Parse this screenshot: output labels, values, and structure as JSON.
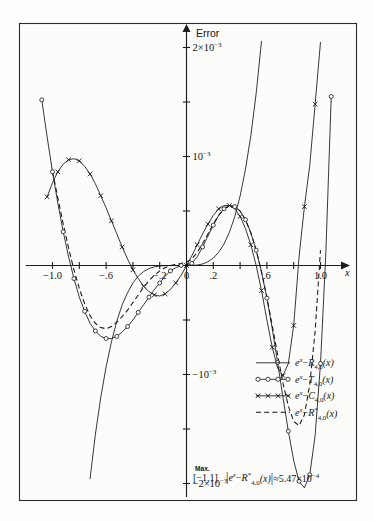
{
  "chart_data": {
    "type": "line",
    "title": "",
    "xlabel": "x",
    "ylabel": "Error",
    "xlim": [
      -1.12,
      1.12
    ],
    "ylim": [
      -0.00235,
      0.00235
    ],
    "grid": false,
    "legend_position": "bottom-right",
    "x_ticks": [
      {
        "value": -1.0,
        "label": "−1.0"
      },
      {
        "value": -0.8,
        "label": ""
      },
      {
        "value": -0.6,
        "label": "−.6"
      },
      {
        "value": -0.4,
        "label": ""
      },
      {
        "value": -0.2,
        "label": "−.2"
      },
      {
        "value": 0.0,
        "label": "0"
      },
      {
        "value": 0.2,
        "label": ".2"
      },
      {
        "value": 0.4,
        "label": ""
      },
      {
        "value": 0.6,
        "label": ".6"
      },
      {
        "value": 0.8,
        "label": ""
      },
      {
        "value": 1.0,
        "label": "1.0"
      }
    ],
    "y_ticks": [
      {
        "value": 0.002,
        "label": "2×10⁻³"
      },
      {
        "value": 0.0015,
        "label": ""
      },
      {
        "value": 0.001,
        "label": "10⁻³"
      },
      {
        "value": 0.0005,
        "label": ""
      },
      {
        "value": -0.0005,
        "label": ""
      },
      {
        "value": -0.001,
        "label": "−10⁻³"
      },
      {
        "value": -0.0015,
        "label": ""
      },
      {
        "value": -0.002,
        "label": "−2×10⁻³"
      }
    ],
    "series": [
      {
        "name": "e^x-R_{4,0}(x)",
        "style": "solid",
        "marker": "none",
        "x": [
          -0.76,
          -0.72,
          -0.68,
          -0.64,
          -0.6,
          -0.56,
          -0.52,
          -0.48,
          -0.44,
          -0.4,
          -0.36,
          -0.32,
          -0.28,
          -0.24,
          -0.2,
          -0.16,
          -0.12,
          -0.08,
          -0.04,
          0.0,
          0.04,
          0.08,
          0.12,
          0.16,
          0.2,
          0.24,
          0.28,
          0.32,
          0.36,
          0.4,
          0.44,
          0.48,
          0.52,
          0.56,
          0.6,
          0.64,
          0.68,
          0.72,
          0.76,
          0.8
        ],
        "y": [
          -0.00245,
          -0.00196,
          -0.00155,
          -0.00121,
          -0.00093,
          -0.0007,
          -0.00051,
          -0.00036,
          -0.00025,
          -0.00016,
          -9.8e-05,
          -5.5e-05,
          -2.8e-05,
          -1.25e-05,
          -4.5e-06,
          -1.2e-06,
          -2e-07,
          0.0,
          2e-07,
          0.0,
          5e-07,
          4e-06,
          1.4e-05,
          3.4e-05,
          6.8e-05,
          0.000121,
          0.000197,
          0.000304,
          0.000448,
          0.000637,
          0.000882,
          0.00119,
          0.00158,
          0.00206,
          0.00265,
          0.00336,
          0.00421,
          0.00521,
          0.00639,
          0.00776
        ]
      },
      {
        "name": "e^x-T_{4,0}(x)",
        "style": "solid",
        "marker": "circle",
        "x": [
          -1.08,
          -1.04,
          -1.0,
          -0.96,
          -0.92,
          -0.88,
          -0.84,
          -0.8,
          -0.76,
          -0.72,
          -0.68,
          -0.64,
          -0.6,
          -0.56,
          -0.52,
          -0.48,
          -0.44,
          -0.4,
          -0.36,
          -0.32,
          -0.28,
          -0.24,
          -0.2,
          -0.16,
          -0.12,
          -0.08,
          -0.04,
          0.0,
          0.04,
          0.08,
          0.12,
          0.16,
          0.2,
          0.24,
          0.28,
          0.32,
          0.36,
          0.4,
          0.44,
          0.48,
          0.52,
          0.56,
          0.6,
          0.64,
          0.68,
          0.72,
          0.76,
          0.8,
          0.84,
          0.88,
          0.92,
          0.96,
          1.0,
          1.04,
          1.08
        ],
        "y": [
          0.00152,
          0.00118,
          0.00086,
          0.00057,
          0.00031,
          8e-05,
          -0.00012,
          -0.00029,
          -0.00042,
          -0.00053,
          -0.0006,
          -0.00065,
          -0.00067,
          -0.00067,
          -0.00065,
          -0.00061,
          -0.00056,
          -0.0005,
          -0.00043,
          -0.00036,
          -0.00029,
          -0.00022,
          -0.00016,
          -0.0001,
          -5e-05,
          -2e-05,
          0.0,
          0.0,
          2e-05,
          8e-05,
          0.00017,
          0.00027,
          0.00037,
          0.00046,
          0.00052,
          0.00055,
          0.00054,
          0.0005,
          0.00042,
          0.0003,
          0.00014,
          -6e-05,
          -0.0003,
          -0.00058,
          -0.00089,
          -0.00121,
          -0.00152,
          -0.00179,
          -0.00198,
          -0.00204,
          -0.00192,
          -0.00156,
          -0.0009,
          0.00012,
          0.00155
        ]
      },
      {
        "name": "e^x-C_{4,0}(x)",
        "style": "solid",
        "marker": "cross",
        "x": [
          -1.04,
          -1.0,
          -0.96,
          -0.92,
          -0.88,
          -0.84,
          -0.8,
          -0.76,
          -0.72,
          -0.68,
          -0.64,
          -0.6,
          -0.56,
          -0.52,
          -0.48,
          -0.44,
          -0.4,
          -0.36,
          -0.32,
          -0.28,
          -0.24,
          -0.2,
          -0.16,
          -0.12,
          -0.08,
          -0.04,
          0.0,
          0.04,
          0.08,
          0.12,
          0.16,
          0.2,
          0.24,
          0.28,
          0.32,
          0.36,
          0.4,
          0.44,
          0.48,
          0.52,
          0.56,
          0.6,
          0.64,
          0.68,
          0.72,
          0.76,
          0.8,
          0.84,
          0.88,
          0.92,
          0.96,
          1.0
        ],
        "y": [
          0.00063,
          0.00076,
          0.00086,
          0.00093,
          0.00097,
          0.00098,
          0.00096,
          0.00091,
          0.00084,
          0.00075,
          0.00064,
          0.00053,
          0.00041,
          0.00029,
          0.00017,
          6e-05,
          -4e-05,
          -0.00012,
          -0.00019,
          -0.00024,
          -0.00027,
          -0.00028,
          -0.00026,
          -0.00022,
          -0.00016,
          -9e-05,
          0.0,
          9e-05,
          0.00019,
          0.00029,
          0.00038,
          0.00046,
          0.00052,
          0.00055,
          0.00055,
          0.00052,
          0.00045,
          0.00034,
          0.00019,
          0.0,
          -0.00023,
          -0.0005,
          -0.00075,
          -0.00094,
          -0.00101,
          -0.0009,
          -0.00055,
          8e-05,
          0.00054,
          0.00092,
          0.00148,
          0.00205
        ]
      },
      {
        "name": "e^x-R*_{4,0}(x)",
        "style": "dashed",
        "marker": "none",
        "x": [
          -1.0,
          -0.96,
          -0.92,
          -0.88,
          -0.84,
          -0.8,
          -0.76,
          -0.72,
          -0.68,
          -0.64,
          -0.6,
          -0.56,
          -0.52,
          -0.48,
          -0.44,
          -0.4,
          -0.36,
          -0.32,
          -0.28,
          -0.24,
          -0.2,
          -0.16,
          -0.12,
          -0.08,
          -0.04,
          0.0,
          0.04,
          0.08,
          0.12,
          0.16,
          0.2,
          0.24,
          0.28,
          0.32,
          0.36,
          0.4,
          0.44,
          0.48,
          0.52,
          0.56,
          0.6,
          0.64,
          0.68,
          0.72,
          0.76,
          0.8,
          0.84,
          0.88,
          0.92,
          0.96,
          1.0
        ],
        "y": [
          0.00086,
          0.00062,
          0.00038,
          0.00016,
          -4e-05,
          -0.00021,
          -0.00035,
          -0.00046,
          -0.00053,
          -0.00057,
          -0.00058,
          -0.00056,
          -0.00052,
          -0.00047,
          -0.00041,
          -0.00034,
          -0.00027,
          -0.0002,
          -0.00014,
          -9e-05,
          -5e-05,
          -2e-05,
          0.0,
          1e-05,
          2e-05,
          3e-05,
          6e-05,
          0.00012,
          0.0002,
          0.00029,
          0.00038,
          0.00046,
          0.00052,
          0.00055,
          0.00054,
          0.0005,
          0.00042,
          0.0003,
          0.00014,
          -6e-05,
          -0.00029,
          -0.00055,
          -0.00082,
          -0.00108,
          -0.00129,
          -0.00143,
          -0.00147,
          -0.00137,
          -0.00109,
          -0.0006,
          0.00014
        ]
      }
    ]
  },
  "axes": {
    "y_axis_title": "Error",
    "x_axis_title": "x"
  },
  "legend": {
    "entries": [
      {
        "style": "solid",
        "marker": "none",
        "base": "e",
        "base_sup": "x",
        "minus": "−",
        "fn": "R",
        "sub": "4,0",
        "star": "",
        "arg": "(x)"
      },
      {
        "style": "solid",
        "marker": "circle",
        "base": "e",
        "base_sup": "x",
        "minus": "−",
        "fn": "T",
        "sub": "4,0",
        "star": "",
        "arg": "(x)"
      },
      {
        "style": "solid",
        "marker": "cross",
        "base": "e",
        "base_sup": "x",
        "minus": "−",
        "fn": "C",
        "sub": "4,0",
        "star": "",
        "arg": "(x)"
      },
      {
        "style": "dashed",
        "marker": "none",
        "base": "e",
        "base_sup": "x",
        "minus": "−",
        "fn": "R",
        "sub": "4,0",
        "star": "*",
        "arg": "(x)"
      }
    ]
  },
  "caption": {
    "max_word": "Max.",
    "interval": "[−1,1]",
    "bar_open": "|",
    "expr_base": "e",
    "expr_sup": "x",
    "expr_minus": "−",
    "expr_fn": "R",
    "expr_star": "*",
    "expr_sub": "4,0",
    "expr_arg": "(x)",
    "bar_close": "|",
    "approx": "≈",
    "value": "5.47×10",
    "value_exp": "−4"
  },
  "colors": {
    "ink": "#141414",
    "frame": "#2b2b2b",
    "background": "#fdfdfc"
  }
}
